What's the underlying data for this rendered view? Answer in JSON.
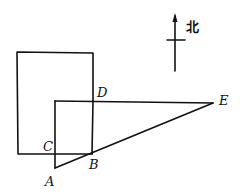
{
  "diagram": {
    "type": "geometry-figure",
    "compass": {
      "label": "北",
      "meaning": "north",
      "shaft": {
        "x": 175,
        "y1": 14,
        "y2": 71
      },
      "crossbar": {
        "y": 40,
        "x1": 167,
        "x2": 185
      },
      "label_pos": {
        "x": 186,
        "y": 31
      }
    },
    "points": {
      "A": {
        "label": "A",
        "x": 55,
        "y": 168,
        "label_x": 45,
        "label_y": 186
      },
      "B": {
        "label": "B",
        "x": 92,
        "y": 154,
        "label_x": 89,
        "label_y": 169
      },
      "C": {
        "label": "C",
        "x": 55,
        "y": 154,
        "label_x": 43,
        "label_y": 151
      },
      "D": {
        "label": "D",
        "x": 93,
        "y": 101,
        "label_x": 97,
        "label_y": 97
      },
      "E": {
        "label": "E",
        "x": 213,
        "y": 103,
        "label_x": 219,
        "label_y": 105
      }
    },
    "shapes": {
      "large_rectangle": {
        "x1": 17,
        "y1": 52,
        "x2": 93,
        "y2": 154
      },
      "small_rectangle": {
        "corners": [
          "C",
          "B",
          "D"
        ],
        "top_y": 101,
        "left_x": 55
      },
      "triangle": {
        "vertices": [
          "A",
          "E",
          "D-line"
        ],
        "segments": [
          "A-E",
          "A-C",
          "C-D-E top edge"
        ]
      }
    }
  }
}
